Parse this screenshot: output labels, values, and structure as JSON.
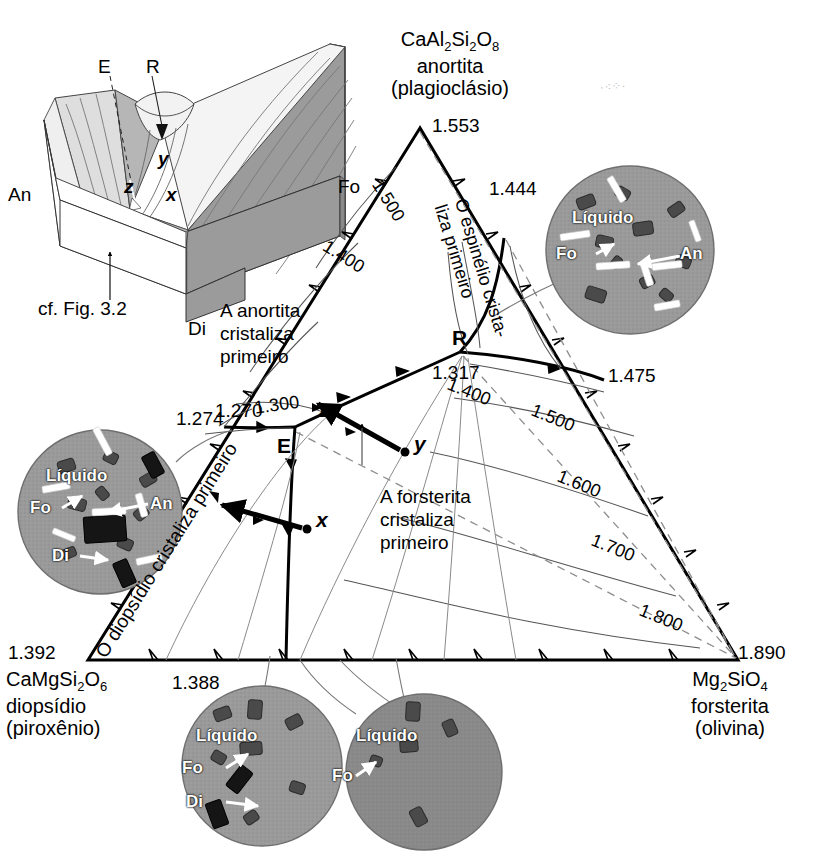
{
  "figure": {
    "type": "ternary-phase-diagram",
    "system": "CaMgSi2O6 - CaAl2Si2O8 - Mg2SiO4",
    "cross_reference": "cf. Fig. 3.2"
  },
  "corners": {
    "top": {
      "formula_pre": "CaAl",
      "formula_parts": [
        "CaAl",
        "2",
        "Si",
        "2",
        "O",
        "8"
      ],
      "mineral": "anortita",
      "group": "(plagioclásio)",
      "value": "1.553"
    },
    "bottom_left": {
      "formula_parts": [
        "CaMgSi",
        "2",
        "O",
        "6"
      ],
      "mineral": "diopsídio",
      "group": "(piroxênio)",
      "value": "1.392"
    },
    "bottom_right": {
      "formula_parts": [
        "Mg",
        "2",
        "SiO",
        "4"
      ],
      "mineral": "forsterita",
      "group": "(olivina)",
      "value": "1.890"
    }
  },
  "invariant_points": {
    "R": {
      "label": "R",
      "value": "1.317"
    },
    "E": {
      "label": "E",
      "value": "1.270"
    },
    "left_edge": {
      "value": "1.274"
    },
    "right_edge": {
      "value": "1.475"
    },
    "an_sp_edge": {
      "value": "1.444"
    },
    "di_fo_edge": {
      "value": "1.388"
    }
  },
  "composition_points": [
    {
      "label": "x"
    },
    {
      "label": "y"
    },
    {
      "label": "z"
    }
  ],
  "edge_labels": {
    "fo_side": "Fo"
  },
  "contours": {
    "unit_note": "temperature isotherms",
    "labels": [
      {
        "value": "1.500",
        "where": "an-top-left"
      },
      {
        "value": "1.400",
        "where": "an-mid-left"
      },
      {
        "value": "1.300",
        "where": "an-lower-left"
      },
      {
        "value": "1.400",
        "where": "fo-upper"
      },
      {
        "value": "1.500",
        "where": "fo-right-1"
      },
      {
        "value": "1.600",
        "where": "fo-right-2"
      },
      {
        "value": "1.700",
        "where": "fo-right-3"
      },
      {
        "value": "1.800",
        "where": "fo-right-4"
      }
    ]
  },
  "fields": {
    "anorthite": "A anortita\ncristaliza\nprimeiro",
    "anorthite_lines": [
      "A anortita",
      "cristaliza",
      "primeiro"
    ],
    "forsterite_lines": [
      "A forsterita",
      "cristaliza",
      "primeiro"
    ],
    "spinel": "O espinélio crista-liza primeiro",
    "spinel_line1": "O espinélio crista-",
    "spinel_line2": "liza primeiro",
    "diopside": "O diopsídio cristaliza primeiro"
  },
  "inset": {
    "labels": {
      "an": "An",
      "di": "Di",
      "fo": "Fo",
      "e": "E",
      "r": "R",
      "x": "x",
      "y": "y",
      "z": "z"
    },
    "caption": "cf. Fig. 3.2"
  },
  "micrographs": [
    {
      "id": "micrograph-an-fo",
      "position": "top-right",
      "liquid": "Líquido",
      "phases": [
        "Fo",
        "An"
      ],
      "bg": "#9a9a9a"
    },
    {
      "id": "micrograph-an-fo-di",
      "position": "left",
      "liquid": "Líquido",
      "phases": [
        "Fo",
        "An",
        "Di"
      ],
      "bg": "#9a9a9a"
    },
    {
      "id": "micrograph-fo-di",
      "position": "bottom-left",
      "liquid": "Líquido",
      "phases": [
        "Fo",
        "Di"
      ],
      "bg": "#9a9a9a"
    },
    {
      "id": "micrograph-fo",
      "position": "bottom-right",
      "liquid": "Líquido",
      "phases": [
        "Fo"
      ],
      "bg": "#8a8a8a"
    }
  ],
  "colors": {
    "ink": "#000000",
    "thin_line": "#5a5a5a",
    "dashed": "#8a8a8a",
    "inset_fill_dark": "#9b9b9b",
    "inset_fill_mid": "#c4c4c4",
    "inset_fill_light": "#e4e4e4",
    "micrograph_bg": "#9a9a9a",
    "micrograph_bg_dark": "#8a8a8a",
    "crystal_dark": "#2a2a2a",
    "crystal_grey": "#6a6a6a"
  }
}
